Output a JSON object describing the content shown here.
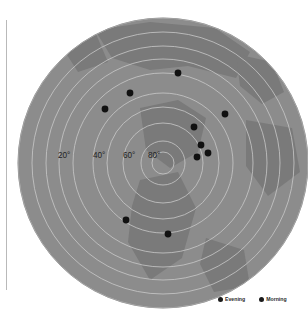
{
  "figure": {
    "kind": "polar-azimuthal-map-scatter",
    "width": 308,
    "height": 310,
    "background_color": "#ffffff"
  },
  "projection": {
    "center_x": 163,
    "center_y": 163,
    "radius": 145,
    "ocean_color": "#8c8c8c",
    "land_color": "#7a7a7a",
    "grid_color": "#c9c9c9",
    "outer_edge_color": "#8a8a8a"
  },
  "axis": {
    "spine_color": "#b9b9b9",
    "spine_label": "left-spine"
  },
  "radial_labels": [
    {
      "text": "20°",
      "x": 58,
      "y": 158
    },
    {
      "text": "40°",
      "x": 93,
      "y": 158
    },
    {
      "text": "60°",
      "x": 123,
      "y": 158
    },
    {
      "text": "80°",
      "x": 148,
      "y": 158
    }
  ],
  "grid_rings": [
    {
      "label": "",
      "r": 145
    },
    {
      "label": "",
      "r": 131
    },
    {
      "label": "",
      "r": 117
    },
    {
      "label": "20°",
      "r": 104
    },
    {
      "label": "",
      "r": 90
    },
    {
      "label": "40°",
      "r": 70
    },
    {
      "label": "",
      "r": 56
    },
    {
      "label": "60°",
      "r": 40
    },
    {
      "label": "80°",
      "r": 22
    },
    {
      "label": "",
      "r": 11
    }
  ],
  "chart_data": {
    "type": "scatter",
    "title": "",
    "xlabel": "",
    "ylabel": "",
    "marker_color": "#111111",
    "marker_size": 3.4,
    "projection": "polar-azimuthal",
    "radial_axis": {
      "unit": "degrees",
      "ticks": [
        20,
        40,
        60,
        80
      ],
      "range": [
        0,
        90
      ],
      "grid": true
    },
    "legend": {
      "position": "bottom-right",
      "entries": [
        "Evening",
        "Morning"
      ]
    },
    "points": [
      {
        "x": 178,
        "y": 73
      },
      {
        "x": 130,
        "y": 93
      },
      {
        "x": 105,
        "y": 109
      },
      {
        "x": 225,
        "y": 114
      },
      {
        "x": 194,
        "y": 127
      },
      {
        "x": 201,
        "y": 145
      },
      {
        "x": 208,
        "y": 153
      },
      {
        "x": 197,
        "y": 157
      },
      {
        "x": 126,
        "y": 220
      },
      {
        "x": 168,
        "y": 234
      }
    ]
  },
  "land_shapes": [
    {
      "name": "north-landmass-upper-left",
      "d": "M 95 30 L 150 22 L 215 28 L 250 52 L 236 78 L 188 66 L 150 70 L 112 58 Z"
    },
    {
      "name": "north-landmass-arm",
      "d": "M 236 54 L 272 62 L 284 92 L 262 104 L 240 86 Z"
    },
    {
      "name": "central-landmass",
      "d": "M 140 108 L 178 100 L 206 118 L 198 152 L 170 168 L 146 150 Z"
    },
    {
      "name": "east-landmass",
      "d": "M 246 120 L 292 128 L 300 172 L 268 196 L 246 166 Z"
    },
    {
      "name": "south-landmass",
      "d": "M 140 180 L 178 172 L 196 208 L 182 258 L 150 280 L 128 242 L 132 206 Z"
    },
    {
      "name": "south-east-tip",
      "d": "M 206 238 L 244 250 L 250 286 L 214 292 L 200 264 Z"
    },
    {
      "name": "west-patch",
      "d": "M 60 44 L 96 34 L 108 62 L 78 72 Z"
    }
  ],
  "legend_entries": [
    {
      "label": "Evening",
      "color": "#1a1a1a"
    },
    {
      "label": "Morning",
      "color": "#1a1a1a"
    }
  ]
}
